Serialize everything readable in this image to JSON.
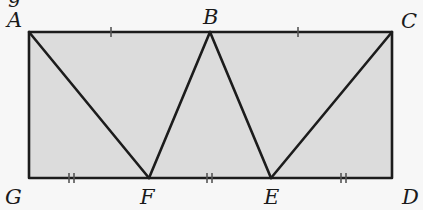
{
  "diagram": {
    "type": "geometry",
    "fill_color": "#dcdcdc",
    "stroke_color": "#1c1c1c",
    "background": "#f7f7f7",
    "points": {
      "A": {
        "label": "A",
        "x": 29,
        "y": 32
      },
      "B": {
        "label": "B",
        "x": 210,
        "y": 32
      },
      "C": {
        "label": "C",
        "x": 392,
        "y": 32
      },
      "D": {
        "label": "D",
        "x": 392,
        "y": 178
      },
      "E": {
        "label": "E",
        "x": 271,
        "y": 178
      },
      "F": {
        "label": "F",
        "x": 149,
        "y": 178
      },
      "G": {
        "label": "G",
        "x": 29,
        "y": 178
      }
    },
    "segments": [
      [
        "A",
        "C"
      ],
      [
        "C",
        "D"
      ],
      [
        "D",
        "G"
      ],
      [
        "G",
        "A"
      ],
      [
        "A",
        "F"
      ],
      [
        "F",
        "B"
      ],
      [
        "B",
        "E"
      ],
      [
        "E",
        "C"
      ]
    ],
    "congruence_marks": {
      "single": [
        "AB",
        "BC"
      ],
      "double": [
        "GF",
        "FE",
        "ED"
      ]
    },
    "top_partial_glyph": "g"
  }
}
